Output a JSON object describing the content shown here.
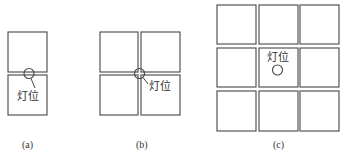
{
  "figure": {
    "panels": [
      {
        "id": "a",
        "caption": "(a)",
        "lamp_label": "灯位",
        "layout": "2 tiles stacked vertically (1 column x 2 rows)",
        "lamp_position": "on the shared edge between the two tiles"
      },
      {
        "id": "b",
        "caption": "(b)",
        "lamp_label": "灯位",
        "layout": "4 tiles (2 x 2 grid)",
        "lamp_position": "at the common corner of the four tiles"
      },
      {
        "id": "c",
        "caption": "(c)",
        "lamp_label": "灯位",
        "layout": "9 tiles (3 x 3 grid)",
        "lamp_position": "at the center of the middle tile"
      }
    ],
    "colors": {
      "line": "#555555",
      "text": "#333333",
      "background": "#ffffff"
    }
  }
}
